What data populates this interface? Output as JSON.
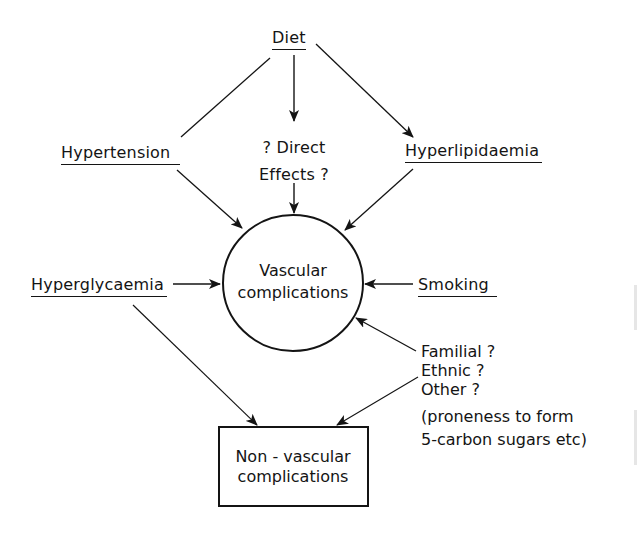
{
  "diagram": {
    "colors": {
      "background": "#ffffff",
      "ink": "#141414"
    },
    "nodes": {
      "diet": {
        "label": "Diet"
      },
      "hypertension": {
        "label": "Hypertension"
      },
      "direct_effects": {
        "line1": "? Direct",
        "line2": "Effects ?"
      },
      "hyperlipidaemia": {
        "label": "Hyperlipidaemia"
      },
      "hyperglycaemia": {
        "label": "Hyperglycaemia"
      },
      "smoking": {
        "label": "Smoking"
      },
      "vascular": {
        "line1": "Vascular",
        "line2": "complications",
        "shape": "circle"
      },
      "non_vascular": {
        "line1": "Non - vascular",
        "line2": "complications",
        "shape": "box"
      },
      "other_factors": {
        "familial": "Familial ?",
        "ethnic": "Ethnic ?",
        "other": "Other ?",
        "note_line1": "(proneness to form",
        "note_line2": "5-carbon sugars etc)"
      }
    },
    "edges": [
      {
        "from": "Diet",
        "to": "Hypertension",
        "arrow": false
      },
      {
        "from": "Diet",
        "to": "? Direct Effects ?",
        "arrow": true
      },
      {
        "from": "Diet",
        "to": "Hyperlipidaemia",
        "arrow": true
      },
      {
        "from": "Hypertension",
        "to": "Vascular complications",
        "arrow": true
      },
      {
        "from": "? Direct Effects ?",
        "to": "Vascular complications",
        "arrow": true
      },
      {
        "from": "Hyperlipidaemia",
        "to": "Vascular complications",
        "arrow": true
      },
      {
        "from": "Hyperglycaemia",
        "to": "Vascular complications",
        "arrow": true
      },
      {
        "from": "Smoking",
        "to": "Vascular complications",
        "arrow": true
      },
      {
        "from": "Familial ?",
        "to": "Vascular complications",
        "arrow": true
      },
      {
        "from": "Hyperglycaemia",
        "to": "Non-vascular complications",
        "arrow": true
      },
      {
        "from": "Other ?",
        "to": "Non-vascular complications",
        "arrow": true
      }
    ]
  }
}
